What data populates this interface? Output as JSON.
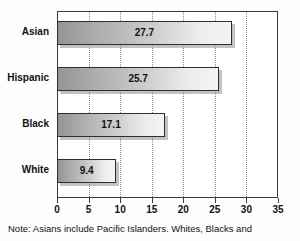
{
  "chart_data": {
    "type": "bar",
    "orientation": "horizontal",
    "title": "",
    "xlabel": "",
    "ylabel": "",
    "categories": [
      "Asian",
      "Hispanic",
      "Black",
      "White"
    ],
    "values": [
      27.7,
      25.7,
      17.1,
      9.4
    ],
    "value_labels": [
      "27.7",
      "25.7",
      "17.1",
      "9.4"
    ],
    "xlim": [
      0,
      35
    ],
    "xticks": [
      0,
      5,
      10,
      15,
      20,
      25,
      30,
      35
    ],
    "xtick_labels": [
      "0",
      "5",
      "10",
      "15",
      "20",
      "25",
      "30",
      "35"
    ],
    "grid": "vertical-dotted",
    "legend": "none",
    "bar_fill_start": "#949494",
    "bar_fill_end": "#f4f4f4",
    "bar_border_color": "#2e2e2e",
    "axis_color": "#3a3a3a",
    "grid_color": "#8d8d8d",
    "text_color": "#111111",
    "background": "#ffffff"
  },
  "footnote": {
    "text": "Note: Asians include Pacific Islanders. Whites, Blacks and"
  }
}
